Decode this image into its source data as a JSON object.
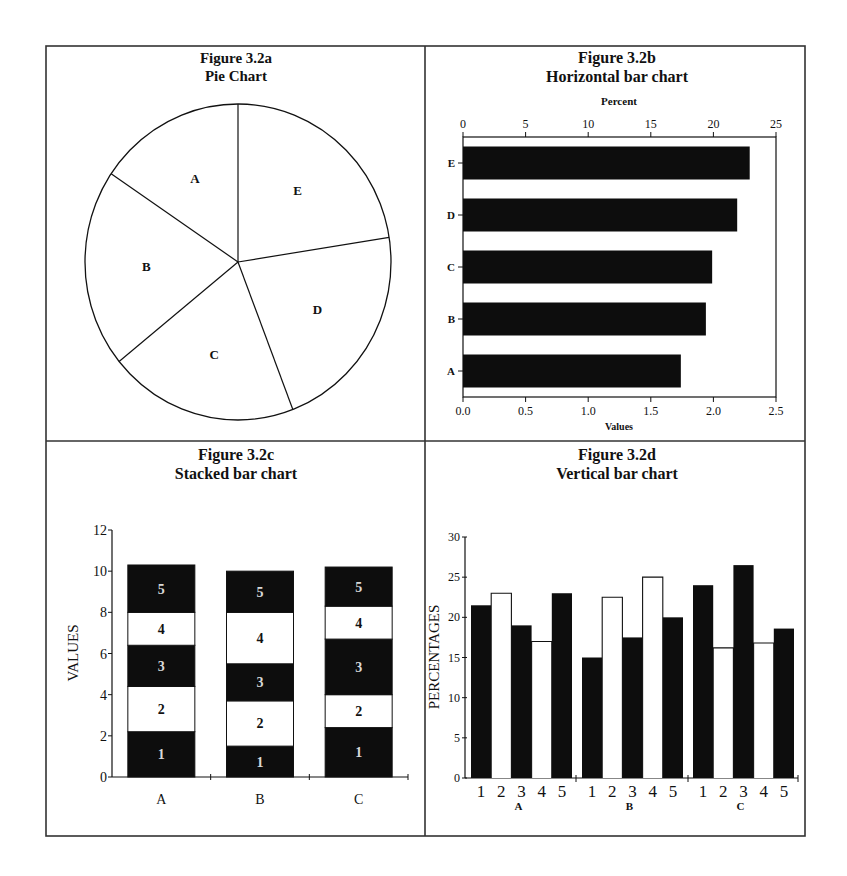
{
  "chart_data": [
    {
      "id": "fig_3_2a",
      "type": "pie",
      "title": "Figure 3.2a",
      "subtitle": "Pie Chart",
      "labels": [
        "A",
        "B",
        "C",
        "D",
        "E"
      ],
      "values": [
        1.74,
        1.94,
        1.99,
        2.19,
        2.29
      ],
      "measured_angles_deg": {
        "E": 81,
        "D": 78,
        "C": 72,
        "B": 73,
        "A": 56
      },
      "start_angle_deg": 0,
      "direction": "clockwise from 12 o'clock: E, D, C, B, A",
      "fill": "#ffffff"
    },
    {
      "id": "fig_3_2b",
      "type": "bar",
      "orientation": "horizontal",
      "title": "Figure 3.2b",
      "subtitle": "Horizontal bar chart",
      "categories": [
        "A",
        "B",
        "C",
        "D",
        "E"
      ],
      "values": [
        1.74,
        1.94,
        1.99,
        2.19,
        2.29
      ],
      "xlabel": "Values",
      "x2label": "Percent",
      "xlim": [
        0,
        2.5
      ],
      "x2lim": [
        0,
        25
      ],
      "xticks": [
        "0.0",
        "0.5",
        "1.0",
        "1.5",
        "2.0",
        "2.5"
      ],
      "x2ticks": [
        "0",
        "5",
        "10",
        "15",
        "20",
        "25"
      ],
      "grid": false,
      "bar_color": "#0d0d0d"
    },
    {
      "id": "fig_3_2c",
      "type": "bar",
      "stacked": true,
      "title": "Figure 3.2c",
      "subtitle": "Stacked bar chart",
      "categories": [
        "A",
        "B",
        "C"
      ],
      "series": [
        {
          "name": "1",
          "values": [
            2.2,
            1.5,
            2.4
          ],
          "fill": "#0d0d0d"
        },
        {
          "name": "2",
          "values": [
            2.2,
            2.2,
            1.6
          ],
          "fill": "#ffffff"
        },
        {
          "name": "3",
          "values": [
            2.0,
            1.8,
            2.7
          ],
          "fill": "#0d0d0d"
        },
        {
          "name": "4",
          "values": [
            1.6,
            2.5,
            1.6
          ],
          "fill": "#ffffff"
        },
        {
          "name": "5",
          "values": [
            2.3,
            2.0,
            1.9
          ],
          "fill": "#0d0d0d"
        }
      ],
      "totals": [
        10.3,
        10.0,
        10.2
      ],
      "ylabel": "VALUES",
      "ylim": [
        0,
        12
      ],
      "yticks": [
        "0",
        "2",
        "4",
        "6",
        "8",
        "10",
        "12"
      ],
      "grid": false
    },
    {
      "id": "fig_3_2d",
      "type": "bar",
      "grouped": true,
      "title": "Figure 3.2d",
      "subtitle": "Vertical bar chart",
      "categories": [
        "A",
        "B",
        "C"
      ],
      "subcategories": [
        "1",
        "2",
        "3",
        "4",
        "5"
      ],
      "series": [
        {
          "name": "1",
          "values": [
            21.5,
            15.0,
            24.0
          ],
          "fill": "#0d0d0d"
        },
        {
          "name": "2",
          "values": [
            23.0,
            22.5,
            16.2
          ],
          "fill": "#ffffff"
        },
        {
          "name": "3",
          "values": [
            19.0,
            17.5,
            26.5
          ],
          "fill": "#0d0d0d"
        },
        {
          "name": "4",
          "values": [
            17.0,
            25.0,
            16.8
          ],
          "fill": "#ffffff"
        },
        {
          "name": "5",
          "values": [
            23.0,
            20.0,
            18.6
          ],
          "fill": "#0d0d0d"
        }
      ],
      "ylabel": "PERCENTAGES",
      "ylim": [
        0,
        30
      ],
      "yticks": [
        "0",
        "5",
        "10",
        "15",
        "20",
        "25",
        "30"
      ],
      "grid": false
    }
  ],
  "panels": {
    "a": {
      "title": "Figure 3.2a",
      "subtitle": "Pie Chart"
    },
    "b": {
      "title": "Figure 3.2b",
      "subtitle": "Horizontal bar chart",
      "top_axis_label": "Percent",
      "bottom_axis_label": "Values"
    },
    "c": {
      "title": "Figure 3.2c",
      "subtitle": "Stacked bar chart",
      "y_axis_label": "VALUES"
    },
    "d": {
      "title": "Figure 3.2d",
      "subtitle": "Vertical bar chart",
      "y_axis_label": "PERCENTAGES"
    }
  },
  "colors": {
    "ink": "#111111",
    "bar_dark": "#0d0d0d",
    "paper": "#ffffff",
    "frame": "#333333"
  }
}
